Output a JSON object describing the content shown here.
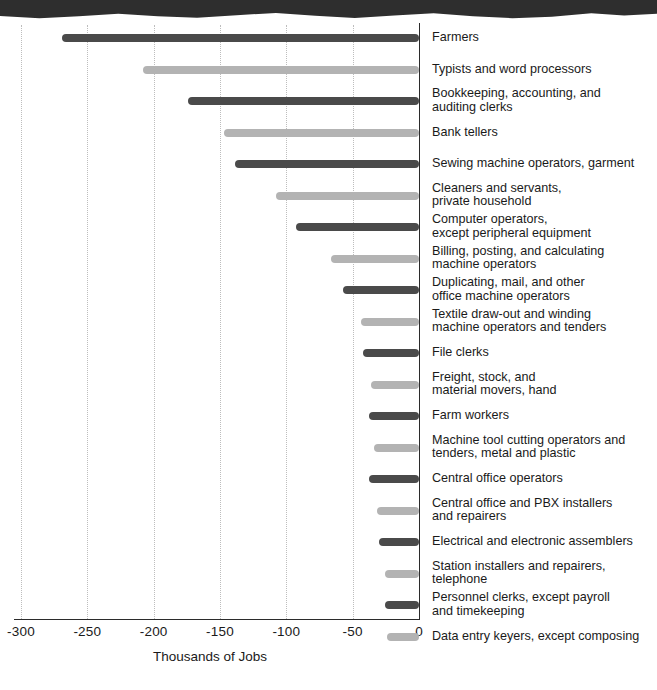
{
  "figure": {
    "top_band": "scan-artifact-band"
  },
  "chart_data": {
    "type": "bar",
    "orientation": "horizontal",
    "title": "",
    "xlabel": "Thousands of Jobs",
    "ylabel": "",
    "xlim": [
      -300,
      0
    ],
    "xticks": [
      -300,
      -250,
      -200,
      -150,
      -100,
      -50,
      0
    ],
    "xticklabels": [
      "-300",
      "-250",
      "-200",
      "-150",
      "-100",
      "-50",
      "0"
    ],
    "grid": "vertical-dotted",
    "legend": "none",
    "colors": {
      "dark": "#4a4a4a",
      "light": "#b3b3b3",
      "axis": "#2b2b2b",
      "gridline": "#bdbdbd"
    },
    "categories": [
      "Farmers",
      "Typists and word processors",
      "Bookkeeping, accounting, and\nauditing clerks",
      "Bank tellers",
      "Sewing machine operators, garment",
      "Cleaners and servants,\nprivate household",
      "Computer operators,\nexcept peripheral equipment",
      "Billing, posting, and calculating\nmachine operators",
      "Duplicating, mail, and other\noffice machine operators",
      "Textile draw-out and winding\nmachine operators and tenders",
      "File clerks",
      "Freight, stock, and\nmaterial movers, hand",
      "Farm workers",
      "Machine tool cutting operators and\ntenders, metal and plastic",
      "Central office operators",
      "Central office and PBX installers\nand repairers",
      "Electrical and electronic assemblers",
      "Station installers and repairers,\ntelephone",
      "Personnel clerks, except payroll\nand timekeeping",
      "Data entry keyers, except composing"
    ],
    "values": [
      -269,
      -208,
      -174,
      -147,
      -139,
      -108,
      -93,
      -66,
      -57,
      -44,
      -42,
      -36,
      -38,
      -34,
      -38,
      -32,
      -30,
      -26,
      -26,
      -24
    ],
    "bar_shades": [
      "dark",
      "light",
      "dark",
      "light",
      "dark",
      "light",
      "dark",
      "light",
      "dark",
      "light",
      "dark",
      "light",
      "dark",
      "light",
      "dark",
      "light",
      "dark",
      "light",
      "dark",
      "light"
    ]
  }
}
